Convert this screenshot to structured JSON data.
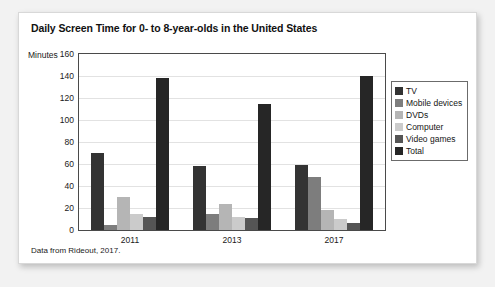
{
  "card": {
    "background": "#ffffff",
    "page_background": "#f2f2f2"
  },
  "title": "Daily Screen Time for 0- to 8-year-olds in the United States",
  "source_note": "Data from Rideout, 2017.",
  "axis": {
    "y_title": "Minutes",
    "y_ticks": [
      "160",
      "140",
      "120",
      "100",
      "80",
      "60",
      "40",
      "20",
      "0"
    ],
    "x_ticks": [
      "2011",
      "2013",
      "2017"
    ]
  },
  "legend": {
    "items": [
      {
        "label": "TV",
        "color": "#333333"
      },
      {
        "label": "Mobile devices",
        "color": "#7d7d7d"
      },
      {
        "label": "DVDs",
        "color": "#b5b5b5"
      },
      {
        "label": "Computer",
        "color": "#cbcbcb"
      },
      {
        "label": "Video games",
        "color": "#555555"
      },
      {
        "label": "Total",
        "color": "#262626"
      }
    ]
  },
  "chart_data": {
    "type": "bar",
    "title": "Daily Screen Time for 0- to 8-year-olds in the United States",
    "xlabel": "",
    "ylabel": "Minutes",
    "ylim": [
      0,
      160
    ],
    "ytick_step": 20,
    "grid": true,
    "legend_position": "right",
    "categories": [
      "2011",
      "2013",
      "2017"
    ],
    "series": [
      {
        "name": "TV",
        "color": "#333333",
        "values": [
          70,
          58,
          59
        ]
      },
      {
        "name": "Mobile devices",
        "color": "#7d7d7d",
        "values": [
          5,
          15,
          48
        ]
      },
      {
        "name": "DVDs",
        "color": "#b5b5b5",
        "values": [
          30,
          24,
          18
        ]
      },
      {
        "name": "Computer",
        "color": "#cbcbcb",
        "values": [
          15,
          12,
          10
        ]
      },
      {
        "name": "Video games",
        "color": "#555555",
        "values": [
          12,
          11,
          6
        ]
      },
      {
        "name": "Total",
        "color": "#262626",
        "values": [
          138,
          115,
          140
        ]
      }
    ],
    "annotations": [
      "Data from Rideout, 2017."
    ]
  }
}
